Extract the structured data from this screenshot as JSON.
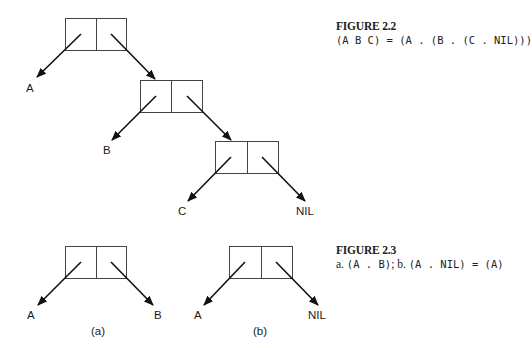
{
  "figures": [
    {
      "id": "figure-2-2",
      "title": "FIGURE 2.2",
      "caption_parts": [
        {
          "text": "(A B C) = (A . (B . (C . NIL)))",
          "style": "mono"
        }
      ]
    },
    {
      "id": "figure-2-3",
      "title": "FIGURE 2.3",
      "caption_parts": [
        {
          "text": "a. ",
          "style": "serif"
        },
        {
          "text": "(A . B)",
          "style": "mono"
        },
        {
          "text": "; b. ",
          "style": "serif"
        },
        {
          "text": "(A . NIL) = (A)",
          "style": "mono"
        }
      ]
    }
  ],
  "cons_cells": [
    {
      "name": "cons-cell-1",
      "x": 65,
      "y": 18,
      "w": 61,
      "h": 32
    },
    {
      "name": "cons-cell-2",
      "x": 140,
      "y": 80,
      "w": 62,
      "h": 32
    },
    {
      "name": "cons-cell-3",
      "x": 215,
      "y": 141,
      "w": 63,
      "h": 32
    },
    {
      "name": "cons-cell-a",
      "x": 65,
      "y": 246,
      "w": 61,
      "h": 32
    },
    {
      "name": "cons-cell-b",
      "x": 229,
      "y": 246,
      "w": 63,
      "h": 32
    }
  ],
  "pointers": [
    {
      "name": "car-pointer-1",
      "x1": 81,
      "y1": 34,
      "x2": 37,
      "y2": 77
    },
    {
      "name": "cdr-pointer-1",
      "x1": 111,
      "y1": 34,
      "x2": 155,
      "y2": 79
    },
    {
      "name": "car-pointer-2",
      "x1": 156,
      "y1": 96,
      "x2": 112,
      "y2": 140
    },
    {
      "name": "cdr-pointer-2",
      "x1": 187,
      "y1": 96,
      "x2": 231,
      "y2": 140
    },
    {
      "name": "car-pointer-3",
      "x1": 231,
      "y1": 157,
      "x2": 188,
      "y2": 201
    },
    {
      "name": "cdr-pointer-3",
      "x1": 262,
      "y1": 157,
      "x2": 305,
      "y2": 201
    },
    {
      "name": "car-pointer-a",
      "x1": 81,
      "y1": 262,
      "x2": 38,
      "y2": 305
    },
    {
      "name": "cdr-pointer-a",
      "x1": 111,
      "y1": 262,
      "x2": 153,
      "y2": 305
    },
    {
      "name": "car-pointer-b",
      "x1": 245,
      "y1": 262,
      "x2": 204,
      "y2": 305
    },
    {
      "name": "cdr-pointer-b",
      "x1": 276,
      "y1": 262,
      "x2": 318,
      "y2": 305
    }
  ],
  "labels": [
    {
      "name": "atom-label-a-top",
      "text": "A",
      "x": 26,
      "y": 92
    },
    {
      "name": "atom-label-b-top",
      "text": "B",
      "x": 103,
      "y": 154
    },
    {
      "name": "atom-label-c-top",
      "text": "C",
      "x": 178,
      "y": 215
    },
    {
      "name": "atom-label-nil-top",
      "text": "NIL",
      "x": 296,
      "y": 215
    },
    {
      "name": "atom-label-a-fig-a",
      "text": "A",
      "x": 27,
      "y": 319
    },
    {
      "name": "atom-label-b-fig-a",
      "text": "B",
      "x": 154,
      "y": 319
    },
    {
      "name": "subfigure-label-a",
      "text": "(a)",
      "x": 91,
      "y": 335
    },
    {
      "name": "atom-label-a-fig-b",
      "text": "A",
      "x": 194,
      "y": 319
    },
    {
      "name": "atom-label-nil-fig-b",
      "text": "NIL",
      "x": 308,
      "y": 319
    },
    {
      "name": "subfigure-label-b",
      "text": "(b)",
      "x": 253,
      "y": 335
    }
  ],
  "caption_positions": [
    {
      "top": 19
    },
    {
      "top": 243
    }
  ]
}
